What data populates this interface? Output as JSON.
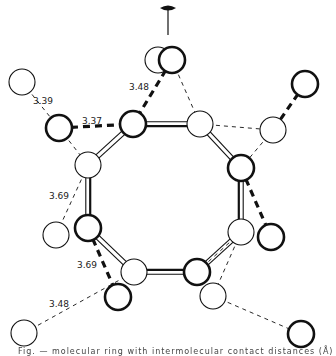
{
  "figure": {
    "type": "molecular packing diagram",
    "symmetry_axis_symbol": "twofold-axis",
    "caption": "Fig. — molecular ring with intermolecular contact distances (Å)",
    "colors": {
      "line": "#111111",
      "background": "#ffffff"
    }
  },
  "ring_atoms": [
    {
      "id": "r1",
      "x": 133,
      "y": 124,
      "bold": true
    },
    {
      "id": "r2",
      "x": 200,
      "y": 124,
      "bold": false
    },
    {
      "id": "r3",
      "x": 241,
      "y": 168,
      "bold": true
    },
    {
      "id": "r4",
      "x": 241,
      "y": 232,
      "bold": false
    },
    {
      "id": "r5",
      "x": 197,
      "y": 272,
      "bold": true
    },
    {
      "id": "r6",
      "x": 134,
      "y": 272,
      "bold": false
    },
    {
      "id": "r7",
      "x": 88,
      "y": 228,
      "bold": true
    },
    {
      "id": "r8",
      "x": 88,
      "y": 165,
      "bold": false
    }
  ],
  "outer_atoms": [
    {
      "id": "o_top_back",
      "x": 158,
      "y": 60,
      "bold": false
    },
    {
      "id": "o_top",
      "x": 172,
      "y": 60,
      "bold": true
    },
    {
      "id": "o_left_far",
      "x": 22,
      "y": 82,
      "bold": false
    },
    {
      "id": "o_left",
      "x": 59,
      "y": 128,
      "bold": true
    },
    {
      "id": "o_right_far",
      "x": 305,
      "y": 84,
      "bold": true
    },
    {
      "id": "o_right",
      "x": 273,
      "y": 130,
      "bold": false
    },
    {
      "id": "o_left_low",
      "x": 56,
      "y": 235,
      "bold": false
    },
    {
      "id": "o_right_low",
      "x": 271,
      "y": 237,
      "bold": true
    },
    {
      "id": "o_bot_left",
      "x": 118,
      "y": 297,
      "bold": true
    },
    {
      "id": "o_bot_right",
      "x": 213,
      "y": 296,
      "bold": false
    },
    {
      "id": "o_corner_left",
      "x": 24,
      "y": 333,
      "bold": false
    },
    {
      "id": "o_corner_right",
      "x": 301,
      "y": 334,
      "bold": true
    }
  ],
  "contacts": [
    {
      "from": "o_left_far",
      "to": "o_left",
      "label": "3.39",
      "lx": 33,
      "ly": 104,
      "heavy": false
    },
    {
      "from": "o_left",
      "to": "r1",
      "label": "3.37",
      "lx": 82,
      "ly": 124,
      "heavy": true
    },
    {
      "from": "o_top",
      "to": "r1",
      "label": "3.48",
      "lx": 129,
      "ly": 90,
      "heavy": true
    },
    {
      "from": "r8",
      "to": "o_left_low",
      "label": "3.69",
      "lx": 49,
      "ly": 199,
      "heavy": false
    },
    {
      "from": "r7",
      "to": "o_bot_left",
      "label": "3.69",
      "lx": 77,
      "ly": 268,
      "heavy": true
    },
    {
      "from": "o_corner_left",
      "to": "r6",
      "label": "3.48",
      "lx": 49,
      "ly": 307,
      "heavy": false
    },
    {
      "from": "o_left",
      "to": "r8",
      "label": "",
      "heavy": false
    },
    {
      "from": "o_top",
      "to": "r2",
      "label": "",
      "heavy": false
    },
    {
      "from": "r2",
      "to": "o_right",
      "label": "",
      "heavy": false
    },
    {
      "from": "o_right",
      "to": "r3",
      "label": "",
      "heavy": false
    },
    {
      "from": "o_right_far",
      "to": "o_right",
      "label": "",
      "heavy": true
    },
    {
      "from": "r3",
      "to": "o_right_low",
      "label": "",
      "heavy": true
    },
    {
      "from": "r4",
      "to": "o_bot_right",
      "label": "",
      "heavy": false
    },
    {
      "from": "r4",
      "to": "r5",
      "label": "",
      "heavy": false
    },
    {
      "from": "o_bot_right",
      "to": "o_corner_right",
      "label": "",
      "heavy": false
    }
  ]
}
